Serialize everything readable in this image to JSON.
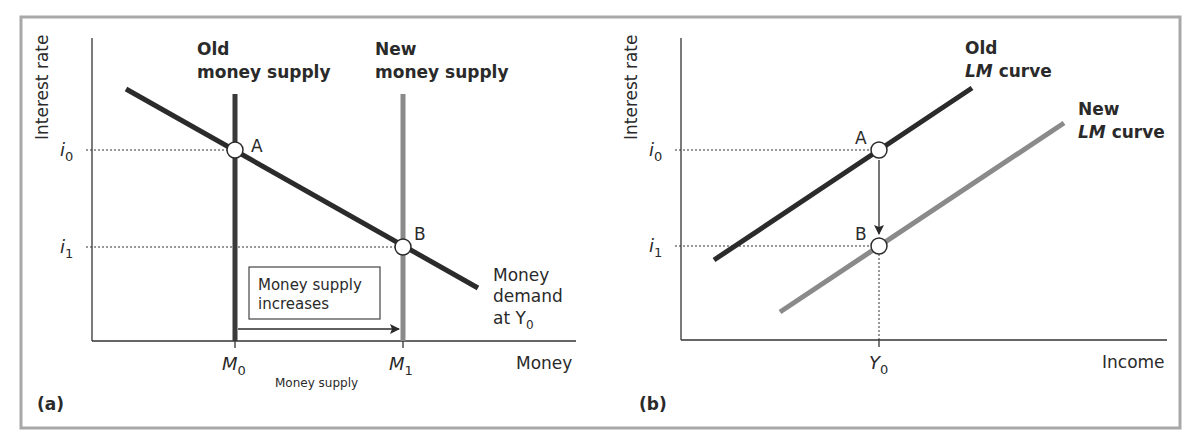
{
  "figure": {
    "colors": {
      "frame": "#a8a8a8",
      "dark_line": "#2b2b2b",
      "light_line": "#8a8a8a",
      "axis": "#333333",
      "text": "#2a2a2a"
    }
  },
  "panel_a": {
    "tag": "(a)",
    "y_axis_label": "Interest rate",
    "x_axis_label": "Money",
    "x_sublabel": "Money supply",
    "y_ticks": {
      "i0": "i",
      "i0_sub": "0",
      "i1": "i",
      "i1_sub": "1"
    },
    "x_ticks": {
      "m0": "M",
      "m0_sub": "0",
      "m1": "M",
      "m1_sub": "1"
    },
    "old_supply_label": [
      "Old",
      "money supply"
    ],
    "new_supply_label": [
      "New",
      "money supply"
    ],
    "demand_label": [
      "Money",
      "demand",
      "at Y",
      "0"
    ],
    "box_label": [
      "Money supply",
      "increases"
    ],
    "point_a": "A",
    "point_b": "B"
  },
  "panel_b": {
    "tag": "(b)",
    "y_axis_label": "Interest rate",
    "x_axis_label": "Income",
    "y_ticks": {
      "i0": "i",
      "i0_sub": "0",
      "i1": "i",
      "i1_sub": "1"
    },
    "x_ticks": {
      "y0": "Y",
      "y0_sub": "0"
    },
    "old_lm_label": [
      "Old",
      "LM",
      " curve"
    ],
    "new_lm_label": [
      "New",
      "LM",
      " curve"
    ],
    "point_a": "A",
    "point_b": "B"
  }
}
